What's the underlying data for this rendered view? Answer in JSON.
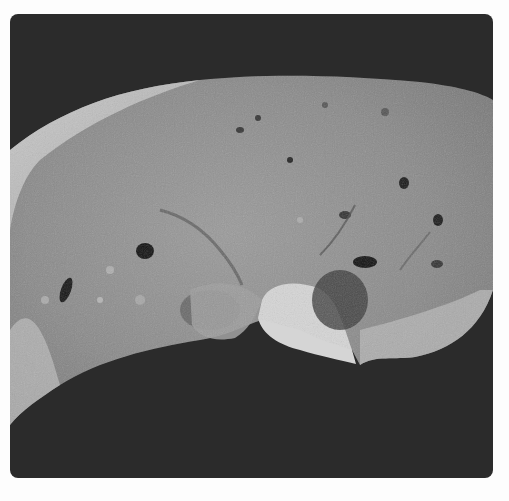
{
  "image": {
    "subject": "grayscale photograph of a sectioned tissue specimen",
    "background_color": "#2b2b2b",
    "page_background": "#fdfdfd",
    "specimen_base_color": "#8f8f8f",
    "specimen_highlight": "#cfcfcf",
    "specimen_shadow": "#5a5a5a"
  }
}
